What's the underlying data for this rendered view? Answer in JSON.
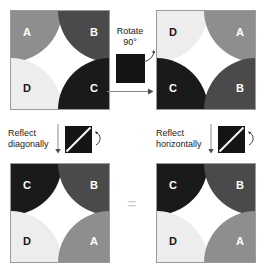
{
  "colors": {
    "quarter_a": "#8e8e8e",
    "quarter_b": "#4a4a4a",
    "quarter_c": "#1a1a1a",
    "quarter_d": "#ededed",
    "label_light": "#ffffff",
    "label_dark": "#1a1a1a",
    "square_border": "#9a9a9a",
    "tile_black": "#141414",
    "equals": "#c9c9c9",
    "background": "#ffffff"
  },
  "diagram": {
    "equals_symbol": "=",
    "squares": [
      {
        "name": "original",
        "quarters": [
          {
            "position": "tl",
            "label": "A",
            "fill": "#8e8e8e",
            "text": "#ffffff"
          },
          {
            "position": "tr",
            "label": "B",
            "fill": "#4a4a4a",
            "text": "#ffffff"
          },
          {
            "position": "bl",
            "label": "D",
            "fill": "#ededed",
            "text": "#1a1a1a"
          },
          {
            "position": "br",
            "label": "C",
            "fill": "#1a1a1a",
            "text": "#ffffff"
          }
        ]
      },
      {
        "name": "rotated-90",
        "quarters": [
          {
            "position": "tl",
            "label": "D",
            "fill": "#ededed",
            "text": "#1a1a1a"
          },
          {
            "position": "tr",
            "label": "A",
            "fill": "#8e8e8e",
            "text": "#ffffff"
          },
          {
            "position": "bl",
            "label": "C",
            "fill": "#1a1a1a",
            "text": "#ffffff"
          },
          {
            "position": "br",
            "label": "B",
            "fill": "#4a4a4a",
            "text": "#ffffff"
          }
        ]
      },
      {
        "name": "reflected-diagonally",
        "quarters": [
          {
            "position": "tl",
            "label": "C",
            "fill": "#1a1a1a",
            "text": "#ffffff"
          },
          {
            "position": "tr",
            "label": "B",
            "fill": "#4a4a4a",
            "text": "#ffffff"
          },
          {
            "position": "bl",
            "label": "D",
            "fill": "#ededed",
            "text": "#1a1a1a"
          },
          {
            "position": "br",
            "label": "A",
            "fill": "#8e8e8e",
            "text": "#ffffff"
          }
        ]
      },
      {
        "name": "reflected-horizontally",
        "quarters": [
          {
            "position": "tl",
            "label": "C",
            "fill": "#1a1a1a",
            "text": "#ffffff"
          },
          {
            "position": "tr",
            "label": "B",
            "fill": "#4a4a4a",
            "text": "#ffffff"
          },
          {
            "position": "bl",
            "label": "D",
            "fill": "#ededed",
            "text": "#1a1a1a"
          },
          {
            "position": "br",
            "label": "A",
            "fill": "#8e8e8e",
            "text": "#ffffff"
          }
        ]
      }
    ],
    "operations": {
      "rotate": {
        "caption": "Rotate\n90°",
        "tile_icon": "black-square-icon",
        "curve_icon": "curved-rotate-arrow-icon",
        "bar_icon": "horizontal-arrow-icon"
      },
      "reflect_diagonally": {
        "caption": "Reflect\ndiagonally",
        "arrow_icon": "down-arrow-icon",
        "tile_icon": "diagonal-line-square-icon",
        "curve_icon": "curved-reflect-arrow-icon"
      },
      "reflect_horizontally": {
        "caption": "Reflect\nhorizontally",
        "arrow_icon": "down-arrow-icon",
        "tile_icon": "diagonal-line-square-icon",
        "curve_icon": "curved-reflect-arrow-icon"
      }
    }
  }
}
